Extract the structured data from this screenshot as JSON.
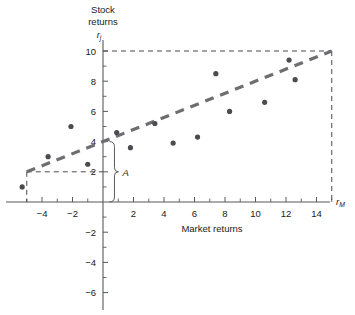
{
  "chart_data": {
    "type": "scatter",
    "title": "Stock returns",
    "ylabel": "Stock returns",
    "ylabel_symbol": "r",
    "ylabel_symbol_sub": "j",
    "xlabel": "Market returns",
    "xlabel_symbol": "r",
    "xlabel_symbol_sub": "M",
    "xlim": [
      -6,
      16
    ],
    "ylim": [
      -7,
      11
    ],
    "xticks_major": [
      -4,
      -2,
      2,
      4,
      6,
      8,
      10,
      12,
      14
    ],
    "xticks_major_labels": [
      "-4",
      "-2",
      "2",
      "4",
      "6",
      "8",
      "10",
      "12",
      "14"
    ],
    "xticks_minor": [
      -5,
      -3,
      -1,
      1,
      3,
      5,
      7,
      9,
      11,
      13,
      15
    ],
    "yticks_major": [
      2,
      4,
      6,
      8,
      10,
      -2,
      -4,
      -6
    ],
    "yticks_major_labels": [
      "2",
      "4",
      "6",
      "8",
      "10",
      "-2",
      "-4",
      "-6"
    ],
    "yticks_minor": [
      1,
      3,
      5,
      7,
      9,
      -1,
      -3,
      -5
    ],
    "grid": false,
    "legend": "none",
    "points": [
      {
        "x": -5.3,
        "y": 1.0
      },
      {
        "x": -3.6,
        "y": 3.0
      },
      {
        "x": -2.1,
        "y": 5.0
      },
      {
        "x": -1.0,
        "y": 2.5
      },
      {
        "x": 0.9,
        "y": 4.6
      },
      {
        "x": 1.8,
        "y": 3.6
      },
      {
        "x": 3.4,
        "y": 5.2
      },
      {
        "x": 4.6,
        "y": 3.9
      },
      {
        "x": 6.2,
        "y": 4.3
      },
      {
        "x": 7.4,
        "y": 8.5
      },
      {
        "x": 8.3,
        "y": 6.0
      },
      {
        "x": 10.6,
        "y": 6.6
      },
      {
        "x": 12.2,
        "y": 9.4
      },
      {
        "x": 12.6,
        "y": 8.1
      }
    ],
    "regression_line": {
      "x_start": -5.0,
      "y_start": 2.0,
      "x_end": 15.0,
      "y_end": 10.0
    },
    "guide_lines": [
      {
        "from": [
          -5.0,
          2.0
        ],
        "to": [
          0,
          2.0
        ],
        "style": "dashed"
      },
      {
        "from": [
          -5.0,
          2.0
        ],
        "to": [
          -5.0,
          0
        ],
        "style": "dashed"
      },
      {
        "from": [
          0,
          10.0
        ],
        "to": [
          15.0,
          10.0
        ],
        "style": "dashed"
      },
      {
        "from": [
          15.0,
          10.0
        ],
        "to": [
          15.0,
          0
        ],
        "style": "dashed"
      }
    ],
    "annotations": [
      {
        "label": "A",
        "type": "bracket",
        "x": 0.75,
        "y_from": 0,
        "y_to": 4.0
      }
    ]
  }
}
